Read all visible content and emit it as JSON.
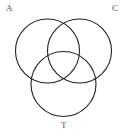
{
  "diagram": {
    "type": "venn",
    "sets": [
      {
        "label": "A",
        "cx": 47.5,
        "cy": 51,
        "r": 32
      },
      {
        "label": "C",
        "cx": 79.5,
        "cy": 51,
        "r": 32
      },
      {
        "label": "T",
        "cx": 63.5,
        "cy": 84,
        "r": 32.5
      }
    ],
    "stroke_color": "#222222",
    "background": "#ffffff"
  },
  "labels": {
    "a": "A",
    "c": "C",
    "t": "T"
  }
}
